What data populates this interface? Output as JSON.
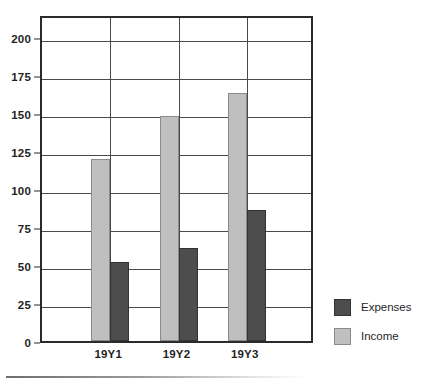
{
  "chart_data": {
    "type": "bar",
    "title": "",
    "subtitle": "",
    "xlabel": "",
    "ylabel": "",
    "categories": [
      "19Y1",
      "19Y2",
      "19Y3"
    ],
    "series": [
      {
        "name": "Expenses",
        "color": "#4d4d4d",
        "values": [
          52,
          61,
          86
        ]
      },
      {
        "name": "Income",
        "color": "#bfbfbf",
        "values": [
          120,
          148,
          163
        ]
      }
    ],
    "series_draw_order": [
      "Income",
      "Expenses"
    ],
    "ylim": [
      0,
      215
    ],
    "yticks": [
      0,
      25,
      50,
      75,
      100,
      125,
      150,
      175,
      200
    ],
    "ytick_labels": [
      "0",
      "25",
      "50",
      "75",
      "100",
      "125",
      "150",
      "175",
      "200"
    ],
    "grid": {
      "horizontal": true,
      "vertical": true
    },
    "legend": {
      "position": "right",
      "entries": [
        "Expenses",
        "Income"
      ]
    },
    "frame": true
  },
  "legend": {
    "entries": [
      {
        "label": "Expenses",
        "swatch": "expenses"
      },
      {
        "label": "Income",
        "swatch": "income"
      }
    ]
  }
}
